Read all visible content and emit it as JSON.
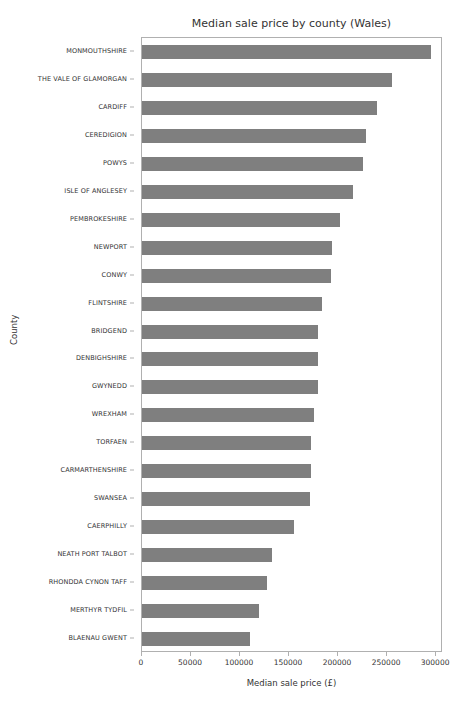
{
  "chart_data": {
    "type": "bar",
    "orientation": "horizontal",
    "title": "Median sale price by county (Wales)",
    "xlabel": "Median sale price (£)",
    "ylabel": "County",
    "xlim": [
      0,
      307000
    ],
    "xticks": [
      0,
      50000,
      100000,
      150000,
      200000,
      250000,
      300000
    ],
    "xtick_labels": [
      "0",
      "50000",
      "100000",
      "150000",
      "200000",
      "250000",
      "300000"
    ],
    "grid": false,
    "legend": null,
    "bar_color": "#7f7f7f",
    "categories": [
      "MONMOUTHSHIRE",
      "THE VALE OF GLAMORGAN",
      "CARDIFF",
      "CEREDIGION",
      "POWYS",
      "ISLE OF ANGLESEY",
      "PEMBROKESHIRE",
      "NEWPORT",
      "CONWY",
      "FLINTSHIRE",
      "BRIDGEND",
      "DENBIGHSHIRE",
      "GWYNEDD",
      "WREXHAM",
      "TORFAEN",
      "CARMARTHENSHIRE",
      "SWANSEA",
      "CAERPHILLY",
      "NEATH PORT TALBOT",
      "RHONDDA CYNON TAFF",
      "MERTHYR TYDFIL",
      "BLAENAU GWENT"
    ],
    "values": [
      295000,
      255000,
      240000,
      228000,
      225000,
      215000,
      202000,
      194000,
      193000,
      184000,
      180000,
      180000,
      179000,
      175000,
      172000,
      172000,
      171000,
      155000,
      133000,
      127000,
      119000,
      110000
    ]
  }
}
